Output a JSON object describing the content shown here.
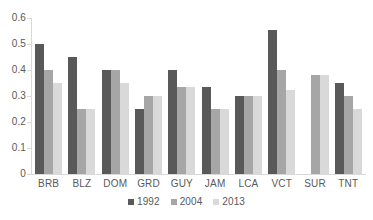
{
  "chart_data": {
    "type": "bar",
    "title": "",
    "subtitle": "",
    "xlabel": "",
    "ylabel": "",
    "ylim": [
      0,
      0.6
    ],
    "yticks": [
      "0",
      "0.1",
      "0.2",
      "0.3",
      "0.4",
      "0.5",
      "0.6"
    ],
    "ytick_values": [
      0,
      0.1,
      0.2,
      0.3,
      0.4,
      0.5,
      0.6
    ],
    "grid": false,
    "legend_position": "bottom-center",
    "categories": [
      "BRB",
      "BLZ",
      "DOM",
      "GRD",
      "GUY",
      "JAM",
      "LCA",
      "VCT",
      "SUR",
      "TNT"
    ],
    "series": [
      {
        "name": "1992",
        "color": "#595959",
        "values": [
          0.5,
          0.45,
          0.4,
          0.25,
          0.4,
          0.333,
          0.3,
          0.555,
          null,
          0.35
        ]
      },
      {
        "name": "2004",
        "color": "#a6a6a6",
        "values": [
          0.4,
          0.25,
          0.4,
          0.3,
          0.333,
          0.25,
          0.3,
          0.4,
          0.38,
          0.3
        ]
      },
      {
        "name": "2013",
        "color": "#d9d9d9",
        "values": [
          0.35,
          0.25,
          0.35,
          0.3,
          0.333,
          0.25,
          0.3,
          0.325,
          0.38,
          0.25
        ]
      }
    ]
  },
  "legend": {
    "items": [
      {
        "label": "1992"
      },
      {
        "label": "2004"
      },
      {
        "label": "2013"
      }
    ]
  },
  "colors": {
    "series_1992": "#595959",
    "series_2004": "#a6a6a6",
    "series_2013": "#d9d9d9",
    "axis": "#d9d9d9",
    "text": "#595959",
    "background": "#ffffff"
  }
}
